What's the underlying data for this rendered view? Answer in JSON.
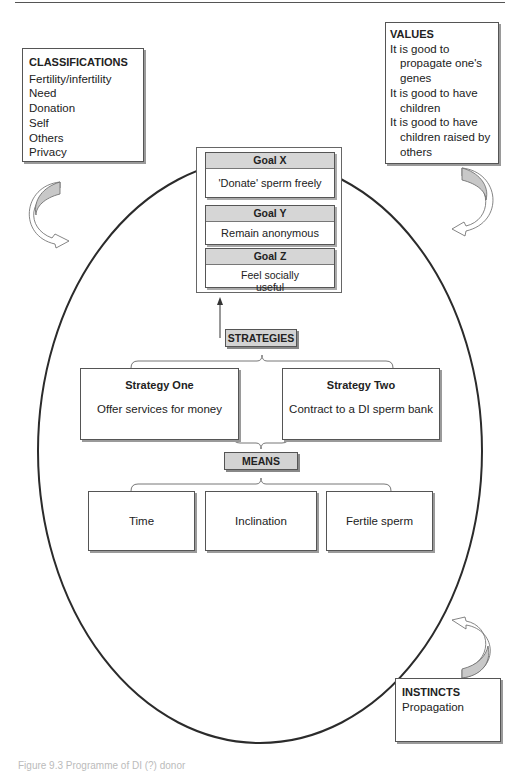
{
  "classifications": {
    "title": "CLASSIFICATIONS",
    "items": [
      "Fertility/infertility",
      "Need",
      "Donation",
      "Self",
      "Others",
      "Privacy"
    ]
  },
  "values": {
    "title": "VALUES",
    "items": [
      [
        "It is good to",
        "propagate one's",
        "genes"
      ],
      [
        "It is good to have",
        "children"
      ],
      [
        "It is good to have",
        "children raised by",
        "others"
      ]
    ]
  },
  "goals": [
    {
      "title": "Goal X",
      "text": "'Donate' sperm freely"
    },
    {
      "title": "Goal Y",
      "text": "Remain anonymous"
    },
    {
      "title": "Goal Z",
      "text": "Feel socially useful"
    }
  ],
  "strategies": {
    "label": "STRATEGIES",
    "items": [
      {
        "title": "Strategy One",
        "text": "Offer services for money"
      },
      {
        "title": "Strategy Two",
        "text": "Contract to a DI sperm bank"
      }
    ]
  },
  "means": {
    "label": "MEANS",
    "items": [
      "Time",
      "Inclination",
      "Fertile sperm"
    ]
  },
  "instincts": {
    "title": "INSTINCTS",
    "items": [
      "Propagation"
    ]
  },
  "caption": "Figure 9.3  Programme of DI (?) donor"
}
